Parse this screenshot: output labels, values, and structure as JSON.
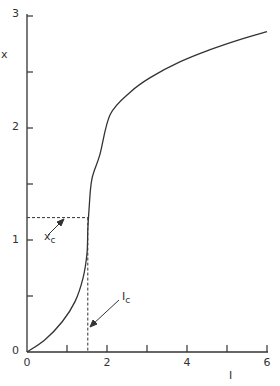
{
  "chart_data": {
    "type": "line",
    "title": "",
    "xlabel": "I",
    "ylabel": "x",
    "xlim": [
      0,
      6
    ],
    "ylim": [
      0,
      3
    ],
    "grid": false,
    "x_ticks": [
      0,
      1,
      2,
      3,
      4,
      5,
      6
    ],
    "x_tick_labels": [
      "0",
      "",
      "2",
      "",
      "4",
      "",
      "6"
    ],
    "y_ticks": [
      0,
      0.5,
      1,
      1.5,
      2,
      2.5,
      3
    ],
    "y_tick_labels": [
      "0",
      "",
      "1",
      "",
      "2",
      "",
      "3"
    ],
    "series": [
      {
        "name": "x(I)",
        "x": [
          0,
          0.45,
          0.88,
          1.2,
          1.4,
          1.5,
          1.52,
          1.55,
          1.62,
          1.82,
          2.08,
          2.58,
          3.08,
          3.82,
          4.58,
          5.32,
          6.0
        ],
        "y": [
          0,
          0.11,
          0.27,
          0.45,
          0.66,
          0.88,
          1.09,
          1.27,
          1.54,
          1.76,
          2.12,
          2.32,
          2.45,
          2.59,
          2.7,
          2.79,
          2.86
        ]
      }
    ],
    "annotations": [
      {
        "text": "x",
        "subscript": "c",
        "value": 1.2,
        "axis": "y",
        "style": "dashed-horizontal"
      },
      {
        "text": "I",
        "subscript": "c",
        "value": 1.52,
        "axis": "x",
        "style": "dashed-vertical"
      }
    ]
  },
  "labels": {
    "xlabel": "I",
    "ylabel": "x",
    "xc_main": "x",
    "xc_sub": "c",
    "ic_main": "I",
    "ic_sub": "c",
    "y0": "0",
    "y1": "1",
    "y2": "2",
    "y3": "3",
    "x0": "0",
    "x2": "2",
    "x4": "4",
    "x6": "6"
  }
}
